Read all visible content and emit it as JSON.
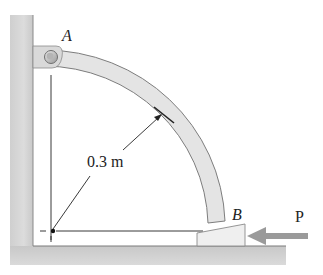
{
  "figure": {
    "type": "statics-diagram",
    "labels": {
      "point_a": "A",
      "point_b": "B",
      "radius": "0.3 m",
      "force": "P"
    },
    "colors": {
      "wall_fill": "#d6d6d6",
      "wall_edge": "#8a8a8a",
      "member_fill": "#e4e4e4",
      "member_edge": "#7d7d7d",
      "wedge_fill": "#efefef",
      "arrow_fill": "#9a9a9a",
      "line": "#222222"
    },
    "elements": [
      {
        "name": "wall",
        "kind": "fixed-support-vertical"
      },
      {
        "name": "floor",
        "kind": "fixed-support-horizontal"
      },
      {
        "name": "pin-A",
        "kind": "pin-connection"
      },
      {
        "name": "curved-member",
        "kind": "quarter-circle-bar",
        "radius": "0.3 m"
      },
      {
        "name": "wedge-B",
        "kind": "wedge-block"
      },
      {
        "name": "force-P",
        "kind": "applied-force",
        "direction": "left"
      }
    ]
  }
}
